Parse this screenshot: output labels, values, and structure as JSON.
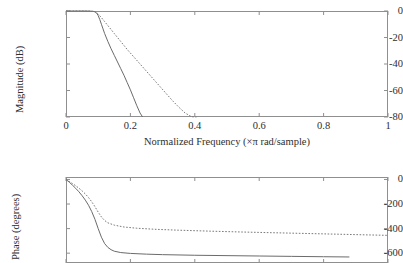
{
  "figure": {
    "background_color": "#ffffff",
    "axis_color": "#8f8f8f",
    "solid_color": "#6b6b6b",
    "dotted_color": "#7a7a7a"
  },
  "chart_data": [
    {
      "type": "line",
      "title": "",
      "xlabel": "Normalized Frequency  (×π rad/sample)",
      "ylabel": "Magnitude (dB)",
      "xlim": [
        0,
        1
      ],
      "ylim": [
        -80,
        0
      ],
      "grid": false,
      "legend": "none",
      "xticks": [
        0,
        0.2,
        0.4,
        0.6,
        0.8,
        1
      ],
      "xticklabels": [
        "0",
        "0.2",
        "0.4",
        "0.6",
        "0.8",
        "1"
      ],
      "yticks": [
        0,
        -20,
        -40,
        -60,
        -80
      ],
      "yticklabels": [
        "0",
        "-20",
        "-40",
        "-60",
        "-80"
      ],
      "series": [
        {
          "name": "filter-a-magnitude",
          "style": "solid",
          "x": [
            0,
            0.02,
            0.04,
            0.06,
            0.075,
            0.085,
            0.09,
            0.095,
            0.1,
            0.105,
            0.11,
            0.115,
            0.12,
            0.13,
            0.14,
            0.15,
            0.16,
            0.17,
            0.18,
            0.19,
            0.2,
            0.21,
            0.22,
            0.23,
            0.238
          ],
          "y": [
            0,
            0,
            0,
            0,
            -0.1,
            -0.3,
            -0.6,
            -1.5,
            -3.5,
            -6.5,
            -10,
            -13.5,
            -17,
            -23,
            -28.5,
            -33.5,
            -38.5,
            -43.5,
            -48.5,
            -54,
            -59.5,
            -65.5,
            -71.5,
            -77,
            -80
          ]
        },
        {
          "name": "filter-b-magnitude",
          "style": "dotted",
          "x": [
            0,
            0.02,
            0.04,
            0.06,
            0.075,
            0.085,
            0.09,
            0.095,
            0.1,
            0.11,
            0.12,
            0.13,
            0.15,
            0.17,
            0.19,
            0.21,
            0.23,
            0.25,
            0.27,
            0.29,
            0.31,
            0.33,
            0.35,
            0.37,
            0.39,
            0.405
          ],
          "y": [
            0,
            0,
            0,
            0,
            -0.1,
            -0.3,
            -0.6,
            -1.2,
            -2.3,
            -5.0,
            -8.0,
            -11.0,
            -17.0,
            -23.0,
            -29.0,
            -34.5,
            -40.0,
            -45.5,
            -51.0,
            -56.5,
            -62.0,
            -67.5,
            -72.5,
            -77.0,
            -79.8,
            -80
          ]
        }
      ]
    },
    {
      "type": "line",
      "title": "",
      "xlabel": "",
      "ylabel": "Phase (degrees)",
      "xlim": [
        0,
        1
      ],
      "ylim": [
        -680,
        20
      ],
      "grid": false,
      "legend": "none",
      "xticks": [
        0,
        0.2,
        0.4,
        0.6,
        0.8,
        1
      ],
      "xticklabels": [
        "",
        "",
        "",
        "",
        "",
        ""
      ],
      "yticks": [
        0,
        -200,
        -400,
        -600
      ],
      "yticklabels": [
        "0",
        "-200",
        "-400",
        "-600"
      ],
      "series": [
        {
          "name": "filter-a-phase",
          "style": "solid",
          "x": [
            0,
            0.01,
            0.02,
            0.03,
            0.04,
            0.05,
            0.06,
            0.07,
            0.08,
            0.09,
            0.1,
            0.11,
            0.12,
            0.13,
            0.14,
            0.15,
            0.17,
            0.2,
            0.25,
            0.3,
            0.4,
            0.5,
            0.6,
            0.7,
            0.8,
            0.88
          ],
          "y": [
            0,
            -22,
            -46,
            -72,
            -100,
            -132,
            -168,
            -210,
            -262,
            -325,
            -400,
            -470,
            -522,
            -553,
            -572,
            -584,
            -595,
            -602,
            -608,
            -612,
            -617,
            -620,
            -623,
            -626,
            -629,
            -631
          ]
        },
        {
          "name": "filter-b-phase",
          "style": "dotted",
          "x": [
            0,
            0.01,
            0.02,
            0.03,
            0.04,
            0.05,
            0.06,
            0.07,
            0.08,
            0.09,
            0.1,
            0.11,
            0.12,
            0.13,
            0.15,
            0.18,
            0.22,
            0.28,
            0.35,
            0.45,
            0.55,
            0.65,
            0.75,
            0.85,
            0.95,
            1
          ],
          "y": [
            0,
            -16,
            -33,
            -51,
            -71,
            -93,
            -118,
            -147,
            -182,
            -222,
            -266,
            -305,
            -334,
            -353,
            -372,
            -387,
            -397,
            -406,
            -413,
            -421,
            -428,
            -434,
            -440,
            -446,
            -452,
            -455
          ]
        }
      ]
    }
  ]
}
